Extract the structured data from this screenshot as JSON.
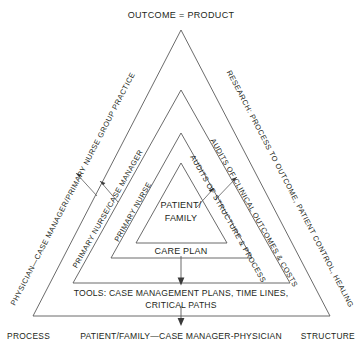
{
  "figure": {
    "type": "nested-triangle-diagram",
    "background_color": "#ffffff",
    "line_color": "#5a5a5a",
    "text_color": "#231f20"
  },
  "top": {
    "title": "OUTCOME = PRODUCT"
  },
  "corners": {
    "left": "PROCESS",
    "right": "STRUCTURE",
    "bottom_center": "PATIENT/FAMILY—CASE MANAGER-PHYSICIAN"
  },
  "left_side_labels": [
    "PHYSICIAN—CASE MANAGER/PRIMARY NURSE GROUP PRACTICE",
    "PRIMARY NURSE/CASE MANAGER",
    "PRIMARY NURSE"
  ],
  "right_side_labels": [
    "RESEARCH: PROCESS TO OUTCOME, PATIENT CONTROL, HEALING",
    "AUDITS OF CLINICAL OUTCOMES & COSTS",
    "AUDITS OF STRUCTURE & PROCESS"
  ],
  "center": {
    "line1": "PATIENT/",
    "line2": "FAMILY"
  },
  "bands": {
    "care_plan": "CARE PLAN",
    "tools_line1": "TOOLS: CASE MANAGEMENT PLANS, TIME LINES,",
    "tools_line2": "CRITICAL PATHS"
  }
}
